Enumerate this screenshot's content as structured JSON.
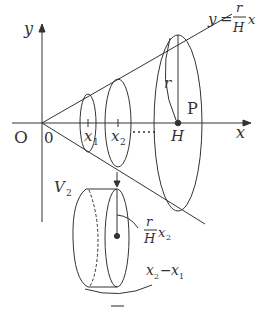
{
  "diagram": {
    "axis_labels": {
      "y": "y",
      "x": "x",
      "origin_letter": "O",
      "origin_zero": "0"
    },
    "line_equation": {
      "lhs": "y",
      "eq": "=",
      "num": "r",
      "den": "H",
      "var": "x"
    },
    "points": {
      "x1": "x",
      "x1_sub": "1",
      "x2": "x",
      "x2_sub": "2",
      "H": "H",
      "P": "P",
      "r": "r"
    },
    "cylinder": {
      "volume_label": "V",
      "volume_sub": "2",
      "radius_num": "r",
      "radius_den": "H",
      "radius_var": "x",
      "radius_sub": "2",
      "thickness": "x",
      "thickness_sub_a": "2",
      "thickness_minus": "−",
      "thickness_b": "x",
      "thickness_sub_b": "1"
    },
    "colors": {
      "stroke": "#333333",
      "background": "#ffffff"
    }
  }
}
